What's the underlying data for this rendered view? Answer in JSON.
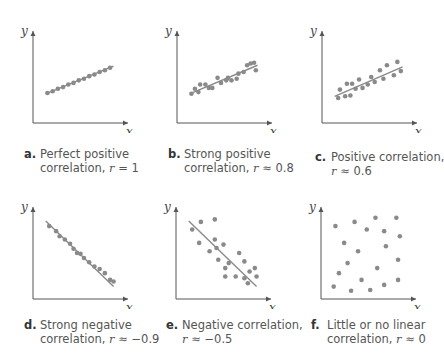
{
  "colors": {
    "axis": "#555555",
    "point": "#8a8a8a",
    "line": "#8a8a8a",
    "caption_text": "#555555",
    "caption_label": "#333333"
  },
  "chart_data": [
    {
      "type": "scatter",
      "id": "a",
      "label": "a.",
      "caption_line1": "Perfect positive",
      "caption_line2_prefix": "correlation, ",
      "r_symbol": "r",
      "r_relation": " = 1",
      "title": "Perfect positive correlation, r = 1",
      "xlabel": "x",
      "ylabel": "y",
      "r": 1,
      "fit_line": [
        [
          0.1,
          0.3
        ],
        [
          0.88,
          0.63
        ]
      ],
      "points": [
        [
          0.12,
          0.31
        ],
        [
          0.18,
          0.33
        ],
        [
          0.24,
          0.36
        ],
        [
          0.3,
          0.38
        ],
        [
          0.36,
          0.41
        ],
        [
          0.42,
          0.43
        ],
        [
          0.48,
          0.46
        ],
        [
          0.54,
          0.48
        ],
        [
          0.6,
          0.51
        ],
        [
          0.66,
          0.53
        ],
        [
          0.72,
          0.56
        ],
        [
          0.78,
          0.58
        ],
        [
          0.84,
          0.61
        ]
      ]
    },
    {
      "type": "scatter",
      "id": "b",
      "label": "b.",
      "caption_line1": "Strong positive",
      "caption_line2_prefix": "correlation, ",
      "r_symbol": "r",
      "r_relation": " ≈ 0.8",
      "title": "Strong positive correlation, r ≈ 0.8",
      "xlabel": "x",
      "ylabel": "y",
      "r": 0.8,
      "fit_line": [
        [
          0.1,
          0.3
        ],
        [
          0.88,
          0.64
        ]
      ],
      "points": [
        [
          0.12,
          0.3
        ],
        [
          0.16,
          0.36
        ],
        [
          0.2,
          0.32
        ],
        [
          0.22,
          0.41
        ],
        [
          0.28,
          0.41
        ],
        [
          0.32,
          0.37
        ],
        [
          0.36,
          0.37
        ],
        [
          0.42,
          0.49
        ],
        [
          0.46,
          0.43
        ],
        [
          0.52,
          0.46
        ],
        [
          0.54,
          0.49
        ],
        [
          0.58,
          0.46
        ],
        [
          0.64,
          0.48
        ],
        [
          0.66,
          0.54
        ],
        [
          0.72,
          0.56
        ],
        [
          0.76,
          0.64
        ],
        [
          0.8,
          0.66
        ],
        [
          0.84,
          0.67
        ],
        [
          0.86,
          0.58
        ]
      ]
    },
    {
      "type": "scatter",
      "id": "c",
      "label": "c.",
      "caption_line1": "Positive correlation,",
      "caption_line2_prefix": "",
      "r_symbol": "r",
      "r_relation": " ≈ 0.6",
      "title": "Positive correlation, r ≈ 0.6",
      "xlabel": "x",
      "ylabel": "y",
      "r": 0.6,
      "fit_line": [
        [
          0.1,
          0.27
        ],
        [
          0.88,
          0.62
        ]
      ],
      "points": [
        [
          0.14,
          0.25
        ],
        [
          0.16,
          0.35
        ],
        [
          0.22,
          0.27
        ],
        [
          0.24,
          0.42
        ],
        [
          0.28,
          0.28
        ],
        [
          0.3,
          0.42
        ],
        [
          0.34,
          0.36
        ],
        [
          0.38,
          0.47
        ],
        [
          0.42,
          0.37
        ],
        [
          0.48,
          0.41
        ],
        [
          0.52,
          0.5
        ],
        [
          0.56,
          0.44
        ],
        [
          0.62,
          0.58
        ],
        [
          0.66,
          0.48
        ],
        [
          0.7,
          0.64
        ],
        [
          0.78,
          0.52
        ],
        [
          0.82,
          0.68
        ],
        [
          0.86,
          0.57
        ]
      ]
    },
    {
      "type": "scatter",
      "id": "d",
      "label": "d.",
      "caption_line1": "Strong negative",
      "caption_line2_prefix": "correlation, ",
      "r_symbol": "r",
      "r_relation": " ≈ −0.9",
      "title": "Strong negative correlation, r ≈ −0.9",
      "xlabel": "x",
      "ylabel": "y",
      "r": -0.9,
      "fit_line": [
        [
          0.1,
          0.88
        ],
        [
          0.88,
          0.1
        ]
      ],
      "points": [
        [
          0.14,
          0.82
        ],
        [
          0.22,
          0.76
        ],
        [
          0.26,
          0.7
        ],
        [
          0.32,
          0.66
        ],
        [
          0.38,
          0.61
        ],
        [
          0.42,
          0.55
        ],
        [
          0.46,
          0.5
        ],
        [
          0.5,
          0.49
        ],
        [
          0.54,
          0.44
        ],
        [
          0.6,
          0.39
        ],
        [
          0.66,
          0.34
        ],
        [
          0.72,
          0.31
        ],
        [
          0.78,
          0.26
        ],
        [
          0.84,
          0.18
        ],
        [
          0.88,
          0.16
        ]
      ]
    },
    {
      "type": "scatter",
      "id": "e",
      "label": "e.",
      "caption_line1": "Negative correlation,",
      "caption_line2_prefix": "",
      "r_symbol": "r",
      "r_relation": " ≈ −0.5",
      "title": "Negative correlation, r ≈ −0.5",
      "xlabel": "x",
      "ylabel": "y",
      "r": -0.5,
      "fit_line": [
        [
          0.1,
          0.88
        ],
        [
          0.88,
          0.1
        ]
      ],
      "points": [
        [
          0.14,
          0.78
        ],
        [
          0.24,
          0.87
        ],
        [
          0.4,
          0.9
        ],
        [
          0.22,
          0.62
        ],
        [
          0.4,
          0.66
        ],
        [
          0.34,
          0.52
        ],
        [
          0.5,
          0.6
        ],
        [
          0.42,
          0.56
        ],
        [
          0.44,
          0.42
        ],
        [
          0.56,
          0.38
        ],
        [
          0.52,
          0.32
        ],
        [
          0.68,
          0.5
        ],
        [
          0.74,
          0.4
        ],
        [
          0.8,
          0.28
        ],
        [
          0.86,
          0.32
        ],
        [
          0.52,
          0.22
        ],
        [
          0.64,
          0.22
        ],
        [
          0.74,
          0.2
        ],
        [
          0.78,
          0.14
        ],
        [
          0.88,
          0.22
        ]
      ]
    },
    {
      "type": "scatter",
      "id": "f",
      "label": "f.",
      "caption_line1": "Little or no linear",
      "caption_line2_prefix": "correlation, ",
      "r_symbol": "r",
      "r_relation": " ≈ 0",
      "title": "Little or no linear correlation, r ≈ 0",
      "xlabel": "x",
      "ylabel": "y",
      "r": 0,
      "fit_line": null,
      "points": [
        [
          0.12,
          0.82
        ],
        [
          0.34,
          0.87
        ],
        [
          0.58,
          0.92
        ],
        [
          0.82,
          0.92
        ],
        [
          0.48,
          0.78
        ],
        [
          0.68,
          0.76
        ],
        [
          0.86,
          0.7
        ],
        [
          0.22,
          0.62
        ],
        [
          0.38,
          0.52
        ],
        [
          0.7,
          0.58
        ],
        [
          0.84,
          0.42
        ],
        [
          0.26,
          0.38
        ],
        [
          0.6,
          0.32
        ],
        [
          0.16,
          0.26
        ],
        [
          0.42,
          0.18
        ],
        [
          0.84,
          0.18
        ],
        [
          0.1,
          0.1
        ],
        [
          0.3,
          0.05
        ],
        [
          0.52,
          0.06
        ],
        [
          0.68,
          0.12
        ]
      ]
    }
  ],
  "panels": {
    "a": {
      "label": "a.",
      "line1": "Perfect positive",
      "line2": "correlation, ",
      "r": "r",
      "rel": " = 1"
    },
    "b": {
      "label": "b.",
      "line1": "Strong positive",
      "line2": "correlation, ",
      "r": "r",
      "rel": " ≈ 0.8"
    },
    "c": {
      "label": "c.",
      "line1": "Positive correlation,",
      "line2": "",
      "r": "r",
      "rel": " ≈ 0.6"
    },
    "d": {
      "label": "d.",
      "line1": "Strong negative",
      "line2": "correlation, ",
      "r": "r",
      "rel": " ≈ −0.9"
    },
    "e": {
      "label": "e.",
      "line1": "Negative correlation,",
      "line2": "",
      "r": "r",
      "rel": " ≈ −0.5"
    },
    "f": {
      "label": "f.",
      "line1": "Little or no linear",
      "line2": "correlation, ",
      "r": "r",
      "rel": " ≈ 0"
    }
  },
  "axes": {
    "x_label": "x",
    "y_label": "y"
  }
}
